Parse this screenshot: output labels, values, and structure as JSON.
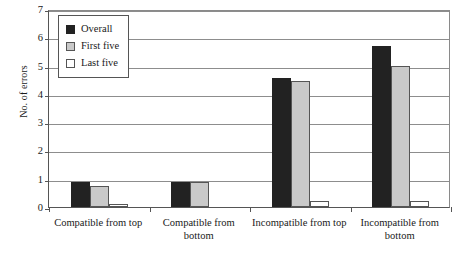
{
  "chart_data": {
    "type": "bar",
    "title": "",
    "subtitle": "",
    "xlabel": "",
    "ylabel": "No. of errors",
    "ylim": [
      0,
      7
    ],
    "ytick_labels": [
      "0",
      "1",
      "2",
      "3",
      "4",
      "5",
      "6",
      "7"
    ],
    "ytick_values": [
      0,
      1,
      2,
      3,
      4,
      5,
      6,
      7
    ],
    "grid": true,
    "legend_position": "top-left",
    "categories": [
      "Compatible from top",
      "Compatible from bottom",
      "Incompatible from top",
      "Incompatible from bottom"
    ],
    "series": [
      {
        "name": "Overall",
        "color": "#222222",
        "values": [
          0.9,
          0.9,
          4.55,
          5.7
        ]
      },
      {
        "name": "First five",
        "color": "#c9c9c9",
        "values": [
          0.75,
          0.87,
          4.45,
          5.0
        ]
      },
      {
        "name": "Last five",
        "color": "#ffffff",
        "values": [
          0.1,
          0.0,
          0.2,
          0.2
        ]
      }
    ]
  },
  "legend": {
    "items": [
      {
        "label": "Overall"
      },
      {
        "label": "First five"
      },
      {
        "label": "Last five"
      }
    ]
  }
}
